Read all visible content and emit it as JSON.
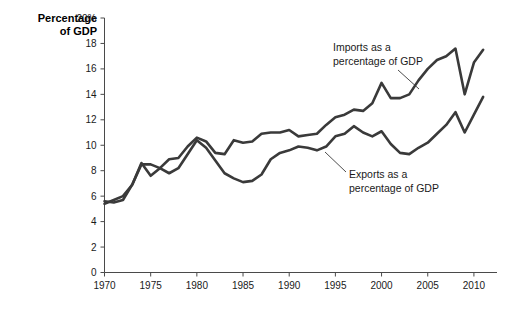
{
  "chart_data": {
    "type": "line",
    "title": "",
    "ylabel": "Percentage of GDP",
    "xlabel": "",
    "ylim": [
      0,
      20
    ],
    "xlim": [
      1970,
      2012.5
    ],
    "grid": false,
    "legend_position": "inline-annotations",
    "y_ticks": [
      "0",
      "2",
      "4",
      "6",
      "8",
      "10",
      "12",
      "14",
      "16",
      "18",
      "20%"
    ],
    "y_tick_values": [
      0,
      2,
      4,
      6,
      8,
      10,
      12,
      14,
      16,
      18,
      20
    ],
    "x_ticks": [
      "1970",
      "1975",
      "1980",
      "1985",
      "1990",
      "1995",
      "2000",
      "2005",
      "2010"
    ],
    "x_tick_values": [
      1970,
      1975,
      1980,
      1985,
      1990,
      1995,
      2000,
      2005,
      2010
    ],
    "x": [
      1970,
      1971,
      1972,
      1973,
      1974,
      1975,
      1976,
      1977,
      1978,
      1979,
      1980,
      1981,
      1982,
      1983,
      1984,
      1985,
      1986,
      1987,
      1988,
      1989,
      1990,
      1991,
      1992,
      1993,
      1994,
      1995,
      1996,
      1997,
      1998,
      1999,
      2000,
      2001,
      2002,
      2003,
      2004,
      2005,
      2006,
      2007,
      2008,
      2009,
      2010,
      2011
    ],
    "series": [
      {
        "name": "Imports as a percentage of GDP",
        "values": [
          5.4,
          5.7,
          6.0,
          6.9,
          8.6,
          7.6,
          8.2,
          8.9,
          9.0,
          9.9,
          10.6,
          10.3,
          9.4,
          9.3,
          10.4,
          10.2,
          10.3,
          10.9,
          11.0,
          11.0,
          11.2,
          10.7,
          10.8,
          10.9,
          11.6,
          12.2,
          12.4,
          12.8,
          12.7,
          13.3,
          14.9,
          13.7,
          13.7,
          14.0,
          15.1,
          16.0,
          16.7,
          17.0,
          17.6,
          14.0,
          16.5,
          17.5
        ]
      },
      {
        "name": "Exports as a percentage of GDP",
        "values": [
          5.6,
          5.5,
          5.7,
          6.9,
          8.5,
          8.5,
          8.2,
          7.8,
          8.2,
          9.3,
          10.4,
          9.8,
          8.8,
          7.8,
          7.4,
          7.1,
          7.2,
          7.7,
          8.9,
          9.4,
          9.6,
          9.9,
          9.8,
          9.6,
          9.9,
          10.7,
          10.9,
          11.5,
          11.0,
          10.7,
          11.1,
          10.1,
          9.4,
          9.3,
          9.8,
          10.2,
          10.9,
          11.6,
          12.6,
          11.0,
          12.4,
          13.8
        ]
      }
    ],
    "annotations": [
      {
        "id": "imports-annotation",
        "line1": "Imports as a",
        "line2": "percentage of GDP"
      },
      {
        "id": "exports-annotation",
        "line1": "Exports as a",
        "line2": "percentage of GDP"
      }
    ]
  },
  "axis": {
    "title_line1": "Percentage",
    "title_line2": "of GDP"
  }
}
